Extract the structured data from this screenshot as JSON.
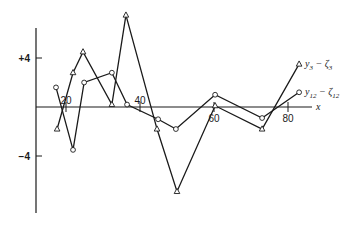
{
  "chart_data": {
    "type": "line",
    "title": "",
    "xlabel": "x",
    "ylabel": "",
    "xlim": [
      0,
      92
    ],
    "ylim": [
      -8.5,
      8.5
    ],
    "grid": false,
    "x_ticks": [
      20,
      40,
      60,
      80
    ],
    "x_tick_labels": [
      "20",
      "40",
      "60",
      "80"
    ],
    "y_ticks": [
      4,
      -4
    ],
    "y_tick_labels": [
      "+4",
      "−4"
    ],
    "legend_position": "inline-right",
    "series": [
      {
        "name": "y3 − ζ3",
        "label_main": "y",
        "label_sub": "3",
        "label_mid": " − ζ",
        "label_sub2": "3",
        "marker": "triangle",
        "x": [
          17.6,
          21.9,
          24.6,
          32.4,
          36.2,
          44.6,
          50.0,
          60.3,
          73.0,
          83.0
        ],
        "values": [
          -1.8,
          2.8,
          4.5,
          0.2,
          7.5,
          -1.8,
          -6.9,
          0.1,
          -1.8,
          3.5
        ]
      },
      {
        "name": "y12 − ζ12",
        "label_main": "y",
        "label_sub": "12",
        "label_mid": " − ζ",
        "label_sub2": "12",
        "marker": "circle",
        "x": [
          17.3,
          21.9,
          24.9,
          32.4,
          36.5,
          44.9,
          49.7,
          60.3,
          73.0,
          83.0
        ],
        "values": [
          1.6,
          -3.5,
          2.0,
          2.8,
          0.2,
          -1.0,
          -1.8,
          1.0,
          -0.9,
          1.2
        ]
      }
    ]
  },
  "colors": {
    "ink": "#1a1a1a",
    "background": "#ffffff"
  }
}
